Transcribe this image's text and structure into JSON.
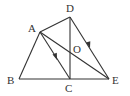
{
  "diagram": {
    "type": "geometry",
    "points": {
      "A": {
        "label": "A",
        "x": 40,
        "y": 32
      },
      "B": {
        "label": "B",
        "x": 19,
        "y": 79
      },
      "C": {
        "label": "C",
        "x": 70,
        "y": 79
      },
      "D": {
        "label": "D",
        "x": 70,
        "y": 17
      },
      "E": {
        "label": "E",
        "x": 109,
        "y": 79
      },
      "O": {
        "label": "O"
      }
    },
    "segments": [
      "AB",
      "BE",
      "AD",
      "DC",
      "DE",
      "AC",
      "AE"
    ],
    "arrows": [
      "AC",
      "DE"
    ],
    "color": "#333333"
  }
}
